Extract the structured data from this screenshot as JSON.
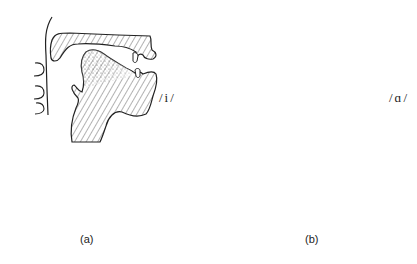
{
  "panels": [
    {
      "id": "a",
      "caption": "(a)",
      "vowel": "/i/",
      "description": "Vocal tract sagittal section for vowel /i/ (tongue high and front)"
    },
    {
      "id": "b",
      "caption": "(b)",
      "vowel": "/ɑ/",
      "description": "Vocal tract sagittal section for vowel /ɑ/ (tongue low and back)"
    }
  ],
  "colors": {
    "ink": "#222222",
    "hatch": "#555555",
    "background": "#ffffff"
  },
  "spectra": [
    {
      "panel": "a",
      "baseline_y": 218,
      "x_start": 17,
      "x_end": 161,
      "lines": [
        {
          "x": 17,
          "top": 209
        },
        {
          "x": 23,
          "top": 174
        },
        {
          "x": 32,
          "top": 204
        },
        {
          "x": 41,
          "top": 209
        },
        {
          "x": 49,
          "top": 209
        },
        {
          "x": 59,
          "top": 205
        },
        {
          "x": 71,
          "top": 206
        },
        {
          "x": 83,
          "top": 208
        },
        {
          "x": 91,
          "top": 199
        },
        {
          "x": 101,
          "top": 195
        },
        {
          "x": 111,
          "top": 179
        },
        {
          "x": 120,
          "top": 200
        },
        {
          "x": 132,
          "top": 203
        },
        {
          "x": 143,
          "top": 174
        },
        {
          "x": 152,
          "top": 201
        },
        {
          "x": 161,
          "top": 208
        }
      ]
    },
    {
      "panel": "b",
      "baseline_y": 218,
      "x_start": 239,
      "x_end": 391,
      "lines": [
        {
          "x": 239,
          "top": 212
        },
        {
          "x": 247,
          "top": 210
        },
        {
          "x": 257,
          "top": 204
        },
        {
          "x": 267,
          "top": 181
        },
        {
          "x": 276,
          "top": 205
        },
        {
          "x": 285,
          "top": 211
        },
        {
          "x": 295,
          "top": 191
        },
        {
          "x": 305,
          "top": 205
        },
        {
          "x": 315,
          "top": 208
        },
        {
          "x": 323,
          "top": 211
        },
        {
          "x": 332,
          "top": 204
        },
        {
          "x": 345,
          "top": 210
        },
        {
          "x": 356,
          "top": 186
        },
        {
          "x": 364,
          "top": 203
        },
        {
          "x": 373,
          "top": 211
        },
        {
          "x": 384,
          "top": 214
        },
        {
          "x": 391,
          "top": 215
        }
      ]
    }
  ]
}
